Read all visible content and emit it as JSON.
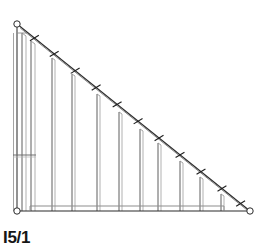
{
  "figure": {
    "caption": "I5/1",
    "type": "technical-line-drawing",
    "background_color": "#ffffff",
    "line_color": "#1a1a1a",
    "light_line_color": "#9a9a9a",
    "canvas": {
      "width": 262,
      "height": 251
    }
  },
  "geometry": {
    "apex_top_left": {
      "x": 17,
      "y": 24
    },
    "corner_bottom_left": {
      "x": 17,
      "y": 211
    },
    "corner_bottom_right": {
      "x": 250,
      "y": 211
    },
    "chords": {
      "vertical_left": {
        "x": 17,
        "y1": 24,
        "y2": 211,
        "label": "left-chord"
      },
      "bottom": {
        "y": 211,
        "x1": 17,
        "x2": 250,
        "label": "bottom-chord"
      },
      "diagonal": {
        "x1": 17,
        "y1": 24,
        "x2": 250,
        "y2": 211,
        "label": "diagonal-chord",
        "double_line_offset": 3
      }
    },
    "bay_inner_bottom": {
      "y": 206,
      "x1": 30,
      "x2": 224
    },
    "cross_member_left_bay": {
      "y": 155,
      "x1": 13,
      "x2": 35
    },
    "top_short_horizontal": {
      "y": 33,
      "x1": 17,
      "x2": 26
    }
  },
  "posts": [
    {
      "index": 1,
      "x": 22,
      "top_y": 33,
      "bottom_y": 211,
      "paired_offset": 4
    },
    {
      "index": 2,
      "x": 31,
      "top_y": 41,
      "bottom_y": 211,
      "paired_offset": 4
    },
    {
      "index": 3,
      "x": 52,
      "top_y": 58,
      "bottom_y": 211,
      "paired_offset": 3
    },
    {
      "index": 4,
      "x": 72,
      "top_y": 74,
      "bottom_y": 211,
      "paired_offset": 3
    },
    {
      "index": 5,
      "x": 97,
      "top_y": 94,
      "bottom_y": 211,
      "paired_offset": 3
    },
    {
      "index": 6,
      "x": 119,
      "top_y": 112,
      "bottom_y": 211,
      "paired_offset": 3
    },
    {
      "index": 7,
      "x": 140,
      "top_y": 129,
      "bottom_y": 211,
      "paired_offset": 3
    },
    {
      "index": 8,
      "x": 158,
      "top_y": 143,
      "bottom_y": 211,
      "paired_offset": 3
    },
    {
      "index": 9,
      "x": 180,
      "top_y": 161,
      "bottom_y": 211,
      "paired_offset": 3
    },
    {
      "index": 10,
      "x": 200,
      "top_y": 177,
      "bottom_y": 211,
      "paired_offset": 3
    },
    {
      "index": 11,
      "x": 221,
      "top_y": 194,
      "bottom_y": 211,
      "paired_offset": 3
    }
  ],
  "diagonal_ticks": [
    {
      "index": 1,
      "t": 0.07
    },
    {
      "index": 2,
      "t": 0.155
    },
    {
      "index": 3,
      "t": 0.245
    },
    {
      "index": 4,
      "t": 0.335
    },
    {
      "index": 5,
      "t": 0.425
    },
    {
      "index": 6,
      "t": 0.515
    },
    {
      "index": 7,
      "t": 0.605
    },
    {
      "index": 8,
      "t": 0.695
    },
    {
      "index": 9,
      "t": 0.785
    },
    {
      "index": 10,
      "t": 0.875
    },
    {
      "index": 11,
      "t": 0.955
    }
  ],
  "pivots": [
    {
      "name": "apex-pivot",
      "x": 17,
      "y": 24,
      "r": 3.2
    },
    {
      "name": "base-left-pivot",
      "x": 17,
      "y": 211,
      "r": 3.2
    },
    {
      "name": "base-right-pivot",
      "x": 250,
      "y": 211,
      "r": 3.2
    }
  ]
}
